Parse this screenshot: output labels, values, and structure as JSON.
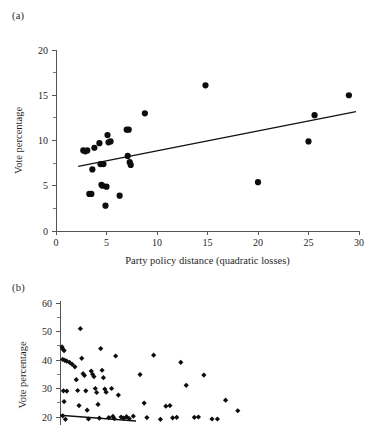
{
  "figure": {
    "panel_a_label": "(a)",
    "panel_b_label": "(b)"
  },
  "chart_data": [
    {
      "id": "panel-a",
      "type": "scatter",
      "title": "",
      "panel_label": "(a)",
      "xlabel": "Party policy distance (quadratic losses)",
      "ylabel": "Vote percentage",
      "xlim": [
        0,
        30
      ],
      "ylim": [
        0,
        20
      ],
      "xticks": [
        0,
        5,
        10,
        15,
        20,
        25,
        30
      ],
      "xtick_labels": [
        "0",
        "5",
        "10",
        "15",
        "20",
        "25",
        "30"
      ],
      "yticks": [
        0,
        5,
        10,
        15,
        20
      ],
      "ytick_labels": [
        "0",
        "5",
        "10",
        "15",
        "20"
      ],
      "y_minor_ticks": [
        2.5,
        7.5,
        12.5,
        17.5
      ],
      "grid": false,
      "legend": "none",
      "marker": "circle",
      "marker_color": "#0d0d0d",
      "points": [
        {
          "x": 2.7,
          "y": 8.9
        },
        {
          "x": 2.9,
          "y": 8.8
        },
        {
          "x": 3.1,
          "y": 8.9
        },
        {
          "x": 3.3,
          "y": 4.1
        },
        {
          "x": 3.5,
          "y": 4.1
        },
        {
          "x": 3.6,
          "y": 6.8
        },
        {
          "x": 3.8,
          "y": 9.2
        },
        {
          "x": 4.3,
          "y": 9.7
        },
        {
          "x": 4.4,
          "y": 7.4
        },
        {
          "x": 4.5,
          "y": 5.1
        },
        {
          "x": 4.6,
          "y": 5.0
        },
        {
          "x": 4.7,
          "y": 7.4
        },
        {
          "x": 4.9,
          "y": 2.8
        },
        {
          "x": 5.0,
          "y": 4.9
        },
        {
          "x": 5.1,
          "y": 10.6
        },
        {
          "x": 5.2,
          "y": 9.8
        },
        {
          "x": 5.4,
          "y": 9.9
        },
        {
          "x": 6.3,
          "y": 3.9
        },
        {
          "x": 7.0,
          "y": 11.2
        },
        {
          "x": 7.1,
          "y": 8.3
        },
        {
          "x": 7.2,
          "y": 11.2
        },
        {
          "x": 7.3,
          "y": 7.6
        },
        {
          "x": 7.4,
          "y": 7.3
        },
        {
          "x": 8.8,
          "y": 13.0
        },
        {
          "x": 14.8,
          "y": 16.1
        },
        {
          "x": 20.0,
          "y": 5.4
        },
        {
          "x": 25.0,
          "y": 9.9
        },
        {
          "x": 25.6,
          "y": 12.8
        },
        {
          "x": 29.0,
          "y": 15.0
        }
      ],
      "fit_line": {
        "x0": 2.2,
        "y0": 7.15,
        "x1": 29.7,
        "y1": 13.2
      }
    },
    {
      "id": "panel-b",
      "type": "scatter",
      "title": "",
      "panel_label": "(b)",
      "xlabel": "",
      "ylabel": "Vote percentage",
      "note": "panel is cropped at the bottom of the image; x axis and its labels are not visible",
      "xlim": [
        0,
        14
      ],
      "ylim": [
        17,
        62
      ],
      "yticks": [
        20,
        30,
        40,
        50,
        60
      ],
      "ytick_labels": [
        "20",
        "30",
        "40",
        "50",
        "60"
      ],
      "y_minor_ticks": [
        25,
        35,
        45,
        55
      ],
      "grid": false,
      "legend": "none",
      "marker": "diamond",
      "marker_color": "#0d0d0d",
      "points": [
        {
          "x": 0.15,
          "y": 44.6
        },
        {
          "x": 0.2,
          "y": 43.9
        },
        {
          "x": 0.3,
          "y": 43.3
        },
        {
          "x": 0.2,
          "y": 40.2
        },
        {
          "x": 0.35,
          "y": 39.9
        },
        {
          "x": 0.5,
          "y": 39.6
        },
        {
          "x": 0.7,
          "y": 39.2
        },
        {
          "x": 0.25,
          "y": 29.2
        },
        {
          "x": 0.5,
          "y": 29.1
        },
        {
          "x": 0.3,
          "y": 25.4
        },
        {
          "x": 0.2,
          "y": 20.4
        },
        {
          "x": 0.4,
          "y": 19.2
        },
        {
          "x": 0.9,
          "y": 38.5
        },
        {
          "x": 1.1,
          "y": 37.6
        },
        {
          "x": 1.2,
          "y": 33.1
        },
        {
          "x": 1.3,
          "y": 29.3
        },
        {
          "x": 1.4,
          "y": 24.0
        },
        {
          "x": 1.5,
          "y": 51.0
        },
        {
          "x": 1.6,
          "y": 40.6
        },
        {
          "x": 1.7,
          "y": 35.2
        },
        {
          "x": 1.8,
          "y": 34.6
        },
        {
          "x": 1.9,
          "y": 29.2
        },
        {
          "x": 2.0,
          "y": 22.4
        },
        {
          "x": 2.1,
          "y": 19.3
        },
        {
          "x": 2.3,
          "y": 36.1
        },
        {
          "x": 2.4,
          "y": 35.0
        },
        {
          "x": 2.5,
          "y": 34.2
        },
        {
          "x": 2.6,
          "y": 30.0
        },
        {
          "x": 2.7,
          "y": 28.6
        },
        {
          "x": 2.8,
          "y": 24.4
        },
        {
          "x": 2.9,
          "y": 19.6
        },
        {
          "x": 3.0,
          "y": 44.0
        },
        {
          "x": 3.1,
          "y": 36.4
        },
        {
          "x": 3.2,
          "y": 33.8
        },
        {
          "x": 3.3,
          "y": 29.8
        },
        {
          "x": 3.4,
          "y": 28.7
        },
        {
          "x": 3.6,
          "y": 19.8
        },
        {
          "x": 3.8,
          "y": 30.0
        },
        {
          "x": 3.9,
          "y": 20.2
        },
        {
          "x": 4.0,
          "y": 19.4
        },
        {
          "x": 4.1,
          "y": 41.4
        },
        {
          "x": 4.3,
          "y": 27.7
        },
        {
          "x": 4.5,
          "y": 20.0
        },
        {
          "x": 4.7,
          "y": 19.6
        },
        {
          "x": 4.9,
          "y": 20.1
        },
        {
          "x": 5.1,
          "y": 19.4
        },
        {
          "x": 5.4,
          "y": 20.3
        },
        {
          "x": 5.9,
          "y": 34.9
        },
        {
          "x": 6.2,
          "y": 24.9
        },
        {
          "x": 6.4,
          "y": 19.8
        },
        {
          "x": 6.9,
          "y": 41.7
        },
        {
          "x": 7.4,
          "y": 19.2
        },
        {
          "x": 7.8,
          "y": 23.8
        },
        {
          "x": 8.1,
          "y": 24.0
        },
        {
          "x": 8.3,
          "y": 19.7
        },
        {
          "x": 8.6,
          "y": 19.9
        },
        {
          "x": 8.9,
          "y": 39.2
        },
        {
          "x": 9.3,
          "y": 31.1
        },
        {
          "x": 9.9,
          "y": 19.9
        },
        {
          "x": 10.2,
          "y": 20.0
        },
        {
          "x": 10.6,
          "y": 34.7
        },
        {
          "x": 11.2,
          "y": 19.3
        },
        {
          "x": 11.6,
          "y": 19.3
        },
        {
          "x": 12.2,
          "y": 25.9
        },
        {
          "x": 13.1,
          "y": 22.2
        }
      ],
      "fit_line": {
        "x0": 0.0,
        "y0": 20.6,
        "x1": 5.6,
        "y1": 18.6
      }
    }
  ]
}
